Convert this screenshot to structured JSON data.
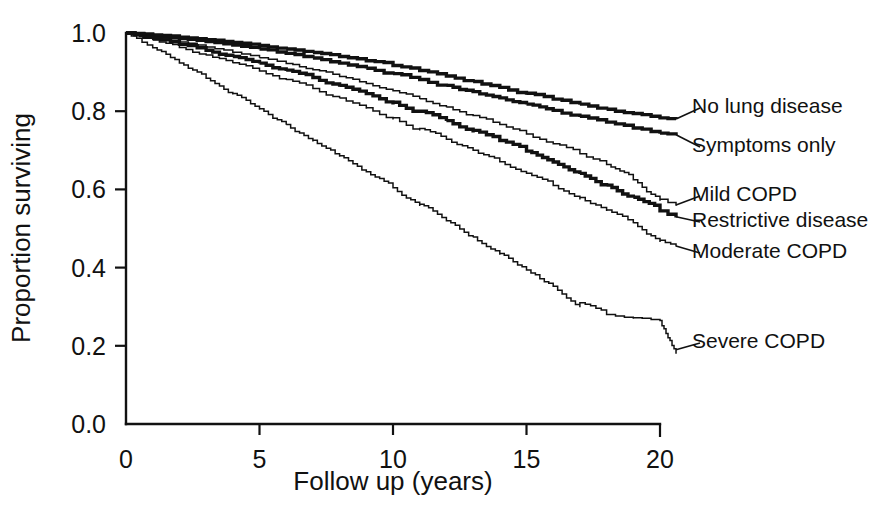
{
  "chart_data": {
    "type": "line",
    "title": "",
    "subtitle": "",
    "xlabel": "Follow up (years)",
    "ylabel": "Proportion surviving",
    "xlim": [
      0,
      20
    ],
    "ylim": [
      0.0,
      1.0
    ],
    "xticks": [
      0,
      5,
      10,
      15,
      20
    ],
    "xtick_labels": [
      "0",
      "5",
      "10",
      "15",
      "20"
    ],
    "yticks": [
      0.0,
      0.2,
      0.4,
      0.6,
      0.8,
      1.0
    ],
    "ytick_labels": [
      "0.0",
      "0.2",
      "0.4",
      "0.6",
      "0.8",
      "1.0"
    ],
    "grid": false,
    "legend_position": "right-inline-labels",
    "curve_style": "kaplan-meier step",
    "series": [
      {
        "name": "No lung disease",
        "label": "No lung disease",
        "stroke": "#111111",
        "weight": "bold",
        "endpoint": 0.78,
        "x": [
          0,
          1,
          2,
          3,
          4,
          5,
          6,
          7,
          8,
          9,
          10,
          11,
          12,
          13,
          14,
          15,
          16,
          17,
          18,
          19,
          20,
          20.6
        ],
        "y": [
          1.0,
          0.995,
          0.989,
          0.983,
          0.976,
          0.968,
          0.959,
          0.95,
          0.94,
          0.929,
          0.917,
          0.904,
          0.89,
          0.876,
          0.861,
          0.846,
          0.831,
          0.818,
          0.805,
          0.794,
          0.783,
          0.78
        ]
      },
      {
        "name": "Symptoms only",
        "label": "Symptoms only",
        "stroke": "#111111",
        "weight": "bold",
        "endpoint": 0.74,
        "x": [
          0,
          1,
          2,
          3,
          4,
          5,
          6,
          7,
          8,
          9,
          10,
          11,
          12,
          13,
          14,
          15,
          16,
          17,
          18,
          19,
          20,
          20.6
        ],
        "y": [
          1.0,
          0.993,
          0.986,
          0.978,
          0.969,
          0.959,
          0.948,
          0.936,
          0.923,
          0.91,
          0.896,
          0.881,
          0.866,
          0.85,
          0.834,
          0.818,
          0.802,
          0.787,
          0.772,
          0.757,
          0.744,
          0.74
        ]
      },
      {
        "name": "Mild COPD",
        "label": "Mild COPD",
        "stroke": "#111111",
        "weight": "thin",
        "endpoint": 0.56,
        "x": [
          0,
          1,
          2,
          3,
          4,
          5,
          6,
          7,
          8,
          9,
          10,
          11,
          12,
          13,
          14,
          15,
          16,
          17,
          18,
          19,
          20,
          20.6
        ],
        "y": [
          1.0,
          0.989,
          0.977,
          0.964,
          0.951,
          0.937,
          0.922,
          0.906,
          0.889,
          0.871,
          0.852,
          0.832,
          0.811,
          0.789,
          0.766,
          0.742,
          0.717,
          0.691,
          0.664,
          0.625,
          0.575,
          0.562
        ]
      },
      {
        "name": "Restrictive disease",
        "label": "Restrictive disease",
        "stroke": "#111111",
        "weight": "bold",
        "endpoint": 0.53,
        "x": [
          0,
          1,
          2,
          3,
          4,
          5,
          6,
          7,
          8,
          9,
          10,
          11,
          12,
          13,
          14,
          15,
          16,
          17,
          18,
          19,
          20,
          20.6
        ],
        "y": [
          1.0,
          0.986,
          0.971,
          0.956,
          0.94,
          0.923,
          0.905,
          0.886,
          0.866,
          0.845,
          0.823,
          0.8,
          0.776,
          0.751,
          0.725,
          0.698,
          0.67,
          0.641,
          0.611,
          0.58,
          0.545,
          0.532
        ]
      },
      {
        "name": "Moderate COPD",
        "label": "Moderate COPD",
        "stroke": "#111111",
        "weight": "thin",
        "endpoint": 0.455,
        "x": [
          0,
          1,
          2,
          3,
          4,
          5,
          6,
          7,
          8,
          9,
          10,
          11,
          12,
          13,
          14,
          15,
          16,
          17,
          18,
          19,
          20,
          20.6
        ],
        "y": [
          1.0,
          0.982,
          0.963,
          0.944,
          0.924,
          0.903,
          0.881,
          0.858,
          0.834,
          0.809,
          0.783,
          0.756,
          0.728,
          0.7,
          0.671,
          0.641,
          0.61,
          0.579,
          0.547,
          0.515,
          0.47,
          0.455
        ]
      },
      {
        "name": "Severe COPD",
        "label": "Severe COPD",
        "stroke": "#111111",
        "weight": "thin",
        "endpoint": 0.19,
        "x": [
          0,
          1,
          2,
          3,
          4,
          5,
          6,
          7,
          8,
          9,
          10,
          11,
          12,
          13,
          14,
          15,
          16,
          17,
          18,
          19,
          20,
          20.6
        ],
        "y": [
          1.0,
          0.962,
          0.923,
          0.884,
          0.845,
          0.806,
          0.766,
          0.726,
          0.686,
          0.645,
          0.604,
          0.562,
          0.52,
          0.478,
          0.436,
          0.394,
          0.352,
          0.31,
          0.28,
          0.272,
          0.265,
          0.19
        ]
      }
    ]
  },
  "legend": {
    "items": [
      {
        "label": "No lung disease"
      },
      {
        "label": "Symptoms only"
      },
      {
        "label": "Mild COPD"
      },
      {
        "label": "Restrictive disease"
      },
      {
        "label": "Moderate COPD"
      },
      {
        "label": "Severe COPD"
      }
    ]
  }
}
